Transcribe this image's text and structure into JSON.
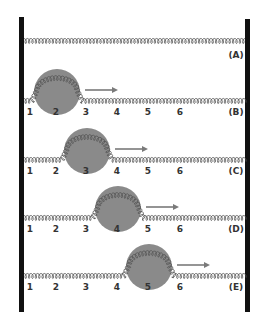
{
  "colors": {
    "wall": "#111111",
    "spring": "#555555",
    "ball": "#8a8a8a",
    "arrow": "#7a7a7a",
    "label": "#333333"
  },
  "top_spring": {
    "label": "(A)"
  },
  "positions": [
    "1",
    "2",
    "3",
    "4",
    "5",
    "6"
  ],
  "rows": [
    {
      "label": "(B)",
      "ball_position": 2,
      "arrow": "right"
    },
    {
      "label": "(C)",
      "ball_position": 3,
      "arrow": "right"
    },
    {
      "label": "(D)",
      "ball_position": 4,
      "arrow": "right"
    },
    {
      "label": "(E)",
      "ball_position": 5,
      "arrow": "right"
    }
  ]
}
